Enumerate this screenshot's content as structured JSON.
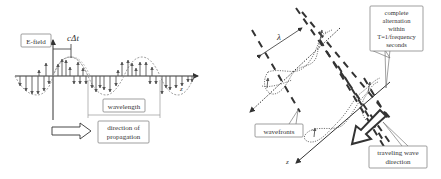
{
  "left_panel": {
    "efield_label": "E-field",
    "cdt_label": "cΔt",
    "wavelength_label": "wavelength",
    "direction_label_line1": "direction of",
    "direction_label_line2": "propagation",
    "axis_label": "z"
  },
  "right_panel": {
    "lambda_label": "λ",
    "alternation_line1": "complete",
    "alternation_line2": "alternation",
    "alternation_line3": "within",
    "alternation_line4": "T=1/frequency",
    "alternation_line5": "seconds",
    "wavefronts_label": "wavefronts",
    "traveling_line1": "traveling wave",
    "traveling_line2": "direction",
    "axis_label": "z"
  },
  "colors": {
    "stroke": "#333333",
    "dashed_wave": "#888888",
    "box_border": "#777777",
    "text": "#333333"
  }
}
